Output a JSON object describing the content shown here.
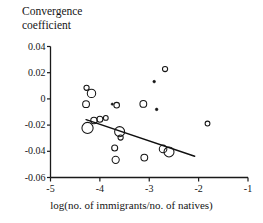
{
  "title": {
    "line1": "Convergence",
    "line2": "coefficient"
  },
  "axes": {
    "xlabel": "log(no. of immigrants/no. of natives)",
    "ylabel": "Convergence coefficient",
    "xticks": [
      "-5",
      "-4",
      "-3",
      "-2",
      "-1"
    ],
    "yticks": [
      "0.04",
      "0.02",
      "0",
      "-0.02",
      "-0.04",
      "-0.06"
    ],
    "xlim": [
      -5,
      -1
    ],
    "ylim": [
      -0.06,
      0.04
    ],
    "grid": false,
    "line_color": "#1a1a1a"
  },
  "chart_data": {
    "type": "scatter",
    "title": "Convergence coefficient",
    "xlabel": "log(no. of immigrants/no. of natives)",
    "ylabel": "Convergence coefficient",
    "xlim": [
      -5,
      -1
    ],
    "ylim": [
      -0.06,
      0.04
    ],
    "xticks": [
      -5,
      -4,
      -3,
      -2,
      -1
    ],
    "yticks": [
      0.04,
      0.02,
      0,
      -0.02,
      -0.04,
      -0.06
    ],
    "grid": false,
    "legend": "none",
    "marker_style": "open-circle, radius proportional to weight",
    "points": [
      {
        "x": -4.27,
        "y": 0.0085,
        "r": 2.6,
        "filled": false
      },
      {
        "x": -4.17,
        "y": 0.0042,
        "r": 4.2,
        "filled": false
      },
      {
        "x": -4.28,
        "y": -0.004,
        "r": 3.4,
        "filled": false
      },
      {
        "x": -4.12,
        "y": -0.0165,
        "r": 3.2,
        "filled": false
      },
      {
        "x": -4.0,
        "y": -0.0155,
        "r": 3.0,
        "filled": false
      },
      {
        "x": -3.88,
        "y": -0.0145,
        "r": 2.4,
        "filled": false
      },
      {
        "x": -4.25,
        "y": -0.0222,
        "r": 5.6,
        "filled": false
      },
      {
        "x": -3.66,
        "y": -0.0048,
        "r": 2.8,
        "filled": false
      },
      {
        "x": -3.75,
        "y": -0.004,
        "r": 1.1,
        "filled": true
      },
      {
        "x": -3.6,
        "y": -0.025,
        "r": 5.0,
        "filled": false
      },
      {
        "x": -3.58,
        "y": -0.0295,
        "r": 2.6,
        "filled": false
      },
      {
        "x": -3.7,
        "y": -0.0375,
        "r": 3.0,
        "filled": false
      },
      {
        "x": -3.68,
        "y": -0.0465,
        "r": 3.6,
        "filled": false
      },
      {
        "x": -3.12,
        "y": -0.0038,
        "r": 3.4,
        "filled": false
      },
      {
        "x": -3.1,
        "y": -0.0448,
        "r": 3.4,
        "filled": false
      },
      {
        "x": -2.9,
        "y": 0.0132,
        "r": 1.3,
        "filled": true
      },
      {
        "x": -2.85,
        "y": -0.008,
        "r": 1.3,
        "filled": true
      },
      {
        "x": -2.68,
        "y": 0.0228,
        "r": 2.6,
        "filled": false
      },
      {
        "x": -2.72,
        "y": -0.0382,
        "r": 3.8,
        "filled": false
      },
      {
        "x": -2.6,
        "y": -0.0405,
        "r": 5.0,
        "filled": false
      },
      {
        "x": -1.82,
        "y": -0.0188,
        "r": 2.4,
        "filled": false
      }
    ],
    "trendline": {
      "x0": -4.28,
      "y0": -0.0158,
      "x1": -2.08,
      "y1": -0.0438,
      "color": "#101010",
      "width": 1.4
    }
  }
}
